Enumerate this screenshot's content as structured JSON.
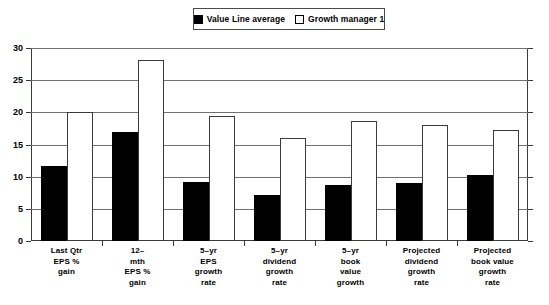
{
  "legend": {
    "entries": [
      {
        "label": "Value Line average",
        "swatch": "filled-square-icon",
        "color": "#000000"
      },
      {
        "label": "Growth manager 1",
        "swatch": "hollow-square-icon",
        "color": "#ffffff"
      }
    ]
  },
  "axis": {
    "y_ticks": [
      "30",
      "25",
      "20",
      "15",
      "10",
      "5",
      "0"
    ]
  },
  "chart_data": {
    "type": "bar",
    "title": "",
    "subtitle": "",
    "xlabel": "",
    "ylabel": "",
    "ylim": [
      0,
      30
    ],
    "ytick_values": [
      0,
      5,
      10,
      15,
      20,
      25,
      30
    ],
    "grid": true,
    "legend_position": "top-center",
    "categories": [
      "Last Qtr EPS % gain",
      "12-mth EPS % gain",
      "5-yr EPS growth rate",
      "5-yr dividend growth rate",
      "5-yr book value growth",
      "Projected dividend growth rate",
      "Projected book value growth rate"
    ],
    "category_lines": [
      [
        "Last Qtr",
        "EPS %",
        "gain"
      ],
      [
        "12–",
        "mth",
        "EPS %",
        "gain"
      ],
      [
        "5–yr",
        "EPS",
        "growth",
        "rate"
      ],
      [
        "5–yr",
        "dividend",
        "growth",
        "rate"
      ],
      [
        "5–yr",
        "book",
        "value",
        "growth"
      ],
      [
        "Projected",
        "dividend",
        "growth",
        "rate"
      ],
      [
        "Projected",
        "book value",
        "growth",
        "rate"
      ]
    ],
    "series": [
      {
        "name": "Value Line average",
        "color": "#000000",
        "values": [
          11.7,
          17.0,
          9.1,
          7.1,
          8.7,
          9.0,
          10.2
        ]
      },
      {
        "name": "Growth manager 1",
        "color": "#ffffff",
        "values": [
          20.0,
          28.1,
          19.4,
          16.0,
          18.7,
          18.0,
          17.3
        ]
      }
    ]
  }
}
